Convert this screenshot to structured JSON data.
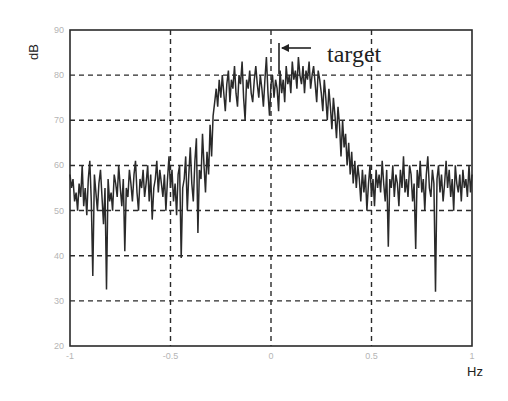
{
  "chart_data": {
    "type": "line",
    "title": "",
    "xlabel": "Hz",
    "ylabel": "dB",
    "xlim": [
      -1,
      1
    ],
    "ylim": [
      20,
      90
    ],
    "grid": true,
    "grid_style": "dashed",
    "legend": null,
    "x_ticks": [
      -1,
      -0.5,
      0,
      0.5,
      1
    ],
    "x_tick_labels": [
      "-1",
      "-0.5",
      "0",
      "0.5",
      "1"
    ],
    "y_ticks": [
      20,
      30,
      40,
      50,
      60,
      70,
      80,
      90
    ],
    "y_tick_labels": [
      "20",
      "30",
      "40",
      "50",
      "60",
      "70",
      "80",
      "90"
    ],
    "annotations": [
      {
        "text": "target",
        "arrow_x": 0.05,
        "arrow_y": 82.5,
        "description": "left-pointing arrow marking peak near 0 Hz"
      }
    ],
    "series": [
      {
        "name": "spectrum",
        "color": "#2a2a2a",
        "x_start": -1,
        "x_end": 1,
        "values": [
          58,
          55,
          57,
          52,
          54,
          50,
          56,
          53,
          60,
          51,
          55,
          49,
          57,
          61,
          52,
          35.5,
          58,
          54,
          50,
          56,
          59,
          53,
          47,
          55,
          32.5,
          57,
          52,
          54,
          50,
          58,
          56,
          53,
          60,
          55,
          51,
          57,
          41,
          55,
          53,
          59,
          56,
          52,
          58,
          61,
          54,
          50,
          57,
          55,
          59,
          53,
          56,
          60,
          52,
          58,
          48,
          55,
          57,
          61,
          54,
          59,
          56,
          53,
          58,
          50,
          57,
          62,
          55,
          59,
          52,
          56,
          49,
          58,
          60,
          39.5,
          55,
          57,
          62,
          50,
          58,
          64,
          56,
          52,
          61,
          66,
          45,
          59,
          57,
          67,
          60,
          54,
          63,
          58,
          69,
          62,
          71,
          74,
          77,
          73,
          79,
          75,
          80,
          76,
          72,
          78,
          81,
          74,
          79,
          77,
          82,
          76,
          73,
          80,
          78,
          83,
          75,
          70,
          79,
          77,
          81,
          76,
          74,
          79,
          82,
          78,
          75,
          80,
          77,
          73,
          79,
          84,
          76,
          71,
          78,
          80,
          75,
          79,
          77,
          72,
          81,
          76,
          79,
          74,
          82,
          78,
          80,
          76,
          83,
          79,
          81,
          77,
          84,
          80,
          78,
          82,
          76,
          81,
          79,
          83,
          77,
          80,
          82,
          78,
          74,
          81,
          79,
          76,
          72,
          79,
          75,
          70,
          77,
          73,
          68,
          75,
          71,
          66,
          73,
          69,
          62,
          70,
          64,
          67,
          60,
          65,
          58,
          63,
          56,
          61,
          55,
          60,
          57,
          52,
          59,
          54,
          58,
          50,
          56,
          60,
          53,
          57,
          51,
          59,
          55,
          58,
          54,
          61,
          56,
          52,
          59,
          42,
          57,
          55,
          60,
          53,
          58,
          56,
          51,
          59,
          55,
          62,
          54,
          57,
          53,
          60,
          58,
          52,
          56,
          41.5,
          59,
          55,
          61,
          54,
          57,
          50,
          58,
          62,
          55,
          53,
          59,
          56,
          32,
          57,
          60,
          54,
          58,
          52,
          56,
          61,
          55,
          59,
          53,
          57,
          50,
          60,
          56,
          54,
          58,
          52,
          59,
          55,
          57,
          53,
          60,
          54,
          58
        ]
      }
    ]
  },
  "annotation": {
    "target_label": "target"
  },
  "axes": {
    "ylabel": "dB",
    "xlabel": "Hz"
  }
}
